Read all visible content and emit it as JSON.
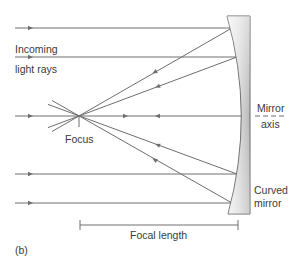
{
  "labels": {
    "incoming_line1": "Incoming",
    "incoming_line2": "light rays",
    "focus": "Focus",
    "mirror_axis_line1": "Mirror",
    "mirror_axis_line2": "axis",
    "curved_mirror_line1": "Curved",
    "curved_mirror_line2": "mirror",
    "focal_length": "Focal length",
    "panel": "(b)"
  },
  "colors": {
    "ray": "#6e6e6e",
    "text": "#3a3a3a",
    "mirror_light": "#f2f2f2",
    "mirror_dark": "#c4c4c4",
    "mirror_outline": "#5a5a5a"
  },
  "geometry": {
    "focus": [
      79,
      116
    ],
    "incoming_ray_y": [
      28,
      57,
      116,
      174,
      203
    ],
    "mirror_hit_x": [
      232,
      237,
      241,
      237,
      232
    ],
    "focal_length_bar": {
      "x1": 80,
      "x2": 238,
      "y": 225
    }
  }
}
